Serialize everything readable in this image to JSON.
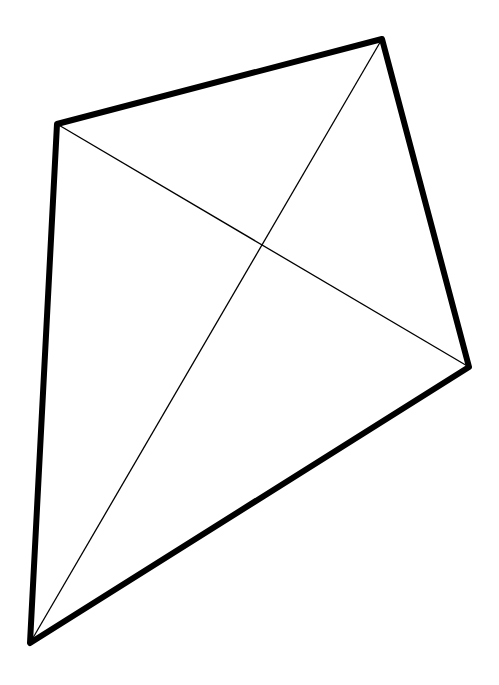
{
  "diagram": {
    "type": "quadrilateral-with-diagonals",
    "shape": "kite",
    "background": "#ffffff",
    "stroke_color": "#000000",
    "outline_width": 6,
    "diagonal_width": 1.3,
    "vertices": {
      "A": [
        57,
        124
      ],
      "B": [
        382,
        39
      ],
      "C": [
        469,
        367
      ],
      "D": [
        30,
        643
      ]
    },
    "diagonals": [
      [
        "A",
        "C"
      ],
      [
        "B",
        "D"
      ]
    ],
    "intersection": [
      262,
      245
    ]
  }
}
